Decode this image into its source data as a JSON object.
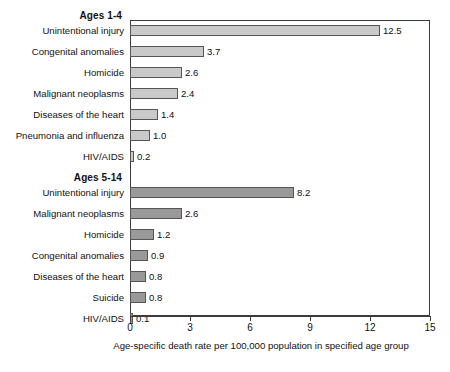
{
  "chart_data": {
    "type": "bar",
    "orientation": "horizontal",
    "title": "",
    "xlabel": "Age-specific death rate per 100,000 population in specified age group",
    "ylabel": "",
    "xlim": [
      0,
      15
    ],
    "xticks": [
      "0",
      "3",
      "6",
      "9",
      "12",
      "15"
    ],
    "grid": false,
    "legend": "none",
    "groups": [
      {
        "name": "Ages 1-4",
        "color": "#c9c9c9",
        "categories": [
          "Unintentional injury",
          "Congenital anomalies",
          "Homicide",
          "Malignant neoplasms",
          "Diseases of the heart",
          "Pneumonia and influenza",
          "HIV/AIDS"
        ],
        "values": [
          12.5,
          3.7,
          2.6,
          2.4,
          1.4,
          1.0,
          0.2
        ],
        "value_labels": [
          "12.5",
          "3.7",
          "2.6",
          "2.4",
          "1.4",
          "1.0",
          "0.2"
        ]
      },
      {
        "name": "Ages 5-14",
        "color": "#999999",
        "categories": [
          "Unintentional injury",
          "Malignant neoplasms",
          "Homicide",
          "Congenital anomalies",
          "Diseases of the heart",
          "Suicide",
          "HIV/AIDS"
        ],
        "values": [
          8.2,
          2.6,
          1.2,
          0.9,
          0.8,
          0.8,
          0.1
        ],
        "value_labels": [
          "8.2",
          "2.6",
          "1.2",
          "0.9",
          "0.8",
          "0.8",
          "0.1"
        ]
      }
    ]
  }
}
